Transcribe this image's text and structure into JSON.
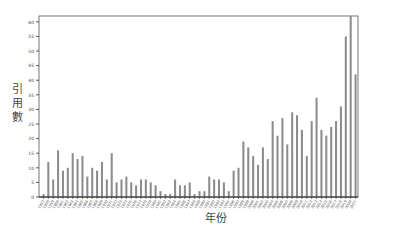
{
  "chart_data": {
    "type": "bar",
    "title": "",
    "xlabel": "年份",
    "ylabel": "引用數",
    "ylim": [
      0,
      62
    ],
    "yticks": [
      0,
      5,
      10,
      15,
      20,
      25,
      30,
      35,
      40,
      45,
      50,
      55,
      60
    ],
    "grid": false,
    "legend": null,
    "bar_color": "#8c8c8c",
    "categories": [
      "1957",
      "1958",
      "1959",
      "1960",
      "1961",
      "1962",
      "1963",
      "1964",
      "1965",
      "1966",
      "1967",
      "1968",
      "1969",
      "1970",
      "1971",
      "1972",
      "1973",
      "1974",
      "1975",
      "1976",
      "1977",
      "1978",
      "1979",
      "1980",
      "1981",
      "1982",
      "1983",
      "1984",
      "1985",
      "1986",
      "1987",
      "1988",
      "1989",
      "1990",
      "1991",
      "1992",
      "1993",
      "1994",
      "1995",
      "1996",
      "1997",
      "1998",
      "1999",
      "2000",
      "2001",
      "2002",
      "2003",
      "2004",
      "2005",
      "2006",
      "2007",
      "2008",
      "2009",
      "2010",
      "2011",
      "2012",
      "2013",
      "2014",
      "2015",
      "2016",
      "2017",
      "2018",
      "2019",
      "2020",
      "2021"
    ],
    "values": [
      1,
      12,
      6,
      16,
      9,
      10,
      15,
      13,
      14,
      7,
      10,
      9,
      12,
      6,
      15,
      5,
      6,
      7,
      5,
      4,
      6,
      6,
      5,
      4,
      2,
      1,
      1,
      6,
      4,
      4,
      5,
      1,
      2,
      2,
      7,
      6,
      6,
      5,
      2,
      9,
      10,
      19,
      17,
      14,
      11,
      17,
      13,
      26,
      21,
      27,
      18,
      29,
      28,
      23,
      14,
      26,
      34,
      23,
      21,
      24,
      26,
      31,
      55,
      62,
      42
    ]
  },
  "labels": {
    "y_chars": [
      "引",
      "用",
      "數"
    ],
    "x": "年份"
  }
}
